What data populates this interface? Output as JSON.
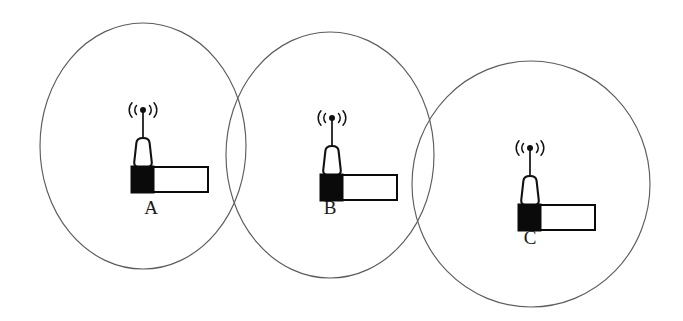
{
  "figure": {
    "kind": "wireless-coverage-diagram",
    "width": 683,
    "height": 321,
    "background_color": "#ffffff",
    "stroke_color": "#5d5d5d",
    "icon_color": "#0a0a0a",
    "label_color": "#1a1a1a"
  },
  "cells": [
    {
      "id": "cell-a",
      "label": "A",
      "label_x": 151,
      "label_y": 214,
      "ellipse": {
        "cx": 143,
        "cy": 146,
        "rx": 103,
        "ry": 123
      },
      "station_x": 124,
      "station_y": 100
    },
    {
      "id": "cell-b",
      "label": "B",
      "label_x": 330,
      "label_y": 214,
      "ellipse": {
        "cx": 330,
        "cy": 155,
        "rx": 104,
        "ry": 123
      },
      "station_x": 313,
      "station_y": 108
    },
    {
      "id": "cell-c",
      "label": "C",
      "label_x": 530,
      "label_y": 244,
      "ellipse": {
        "cx": 531,
        "cy": 184,
        "rx": 119,
        "ry": 123
      },
      "station_x": 511,
      "station_y": 138
    }
  ],
  "station_icon": {
    "name": "base-station-icon",
    "parts": [
      "antenna-mast",
      "signal-wave-left-inner",
      "signal-wave-left-outer",
      "signal-wave-right-inner",
      "signal-wave-right-outer",
      "antenna-dot",
      "tower-body",
      "tower-base-block",
      "equipment-bar"
    ]
  }
}
